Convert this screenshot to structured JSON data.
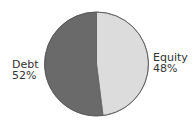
{
  "chart_data": {
    "type": "pie",
    "title": "",
    "categories": [
      "Equity",
      "Debt"
    ],
    "values": [
      48,
      52
    ],
    "units": "%",
    "colors": {
      "Equity": "#dcdcdc",
      "Debt": "#6a6a6a"
    },
    "labels": [
      {
        "name": "Equity",
        "value_label": "48%",
        "position": "right"
      },
      {
        "name": "Debt",
        "value_label": "52%",
        "position": "left"
      }
    ],
    "legend": "none",
    "start_angle": "12 o'clock",
    "direction": "clockwise (Equity first)"
  },
  "labels": {
    "debt": {
      "name": "Debt",
      "value": "52%"
    },
    "equity": {
      "name": "Equity",
      "value": "48%"
    }
  }
}
